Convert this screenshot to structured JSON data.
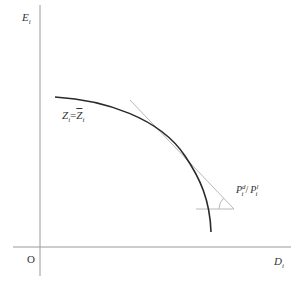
{
  "diagram": {
    "type": "economic-curve",
    "axes": {
      "y_label": {
        "main": "E",
        "sub": "i"
      },
      "x_label": {
        "main": "D",
        "sub": "i"
      },
      "origin_label": "O"
    },
    "curve": {
      "label_lhs": {
        "main": "Z",
        "sub": "i"
      },
      "label_eq": "=",
      "label_rhs": {
        "main": "Z",
        "sub": "i",
        "bar": true
      },
      "points": [
        [
          55,
          97
        ],
        [
          100,
          104
        ],
        [
          150,
          124
        ],
        [
          185,
          156
        ],
        [
          205,
          188
        ],
        [
          211,
          232
        ]
      ]
    },
    "tangent": {
      "from": [
        130,
        100
      ],
      "to": [
        234,
        209
      ],
      "slope_label": {
        "num": {
          "main": "P",
          "sup": "d",
          "sub": "i"
        },
        "sep": "/",
        "den": {
          "main": "P",
          "sup": "l",
          "sub": "i"
        }
      }
    },
    "colors": {
      "axis": "#9a9a9a",
      "curve": "#2a2a2a",
      "tangent": "#b8b8b8",
      "text": "#333333"
    }
  }
}
